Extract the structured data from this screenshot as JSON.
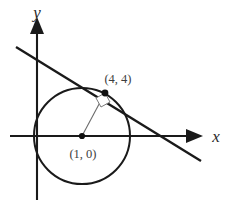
{
  "figure": {
    "background_color": "#ffffff",
    "stroke_color": "#1a1a1a",
    "label_color": "#3d3d3d",
    "radius_color": "#6b6b6b"
  },
  "axes": {
    "x_label": "x",
    "y_label": "y",
    "x_axis": {
      "x1": 10,
      "y1": 136,
      "x2": 186,
      "y2": 136
    },
    "y_axis": {
      "x1": 37,
      "y1": 200,
      "x2": 37,
      "y2": 34
    },
    "x_arrow_points": "186,129 203,136 186,143",
    "y_arrow_points": "30,34 37,17 44,34"
  },
  "circle": {
    "center_x": 82,
    "center_y": 136,
    "radius": 48
  },
  "center_point": {
    "label": "(1, 0)",
    "cx": 82,
    "cy": 136,
    "dot_radius": 3.1,
    "label_x": 83,
    "label_y": 158
  },
  "tangent_point": {
    "label": "(4, 4)",
    "cx": 105,
    "cy": 93,
    "dot_radius": 3.4,
    "label_x": 118,
    "label_y": 83
  },
  "tangent_line": {
    "x1": 16,
    "y1": 47,
    "x2": 201,
    "y2": 161
  },
  "radius_segment": {
    "x1": 82,
    "y1": 136,
    "x2": 105,
    "y2": 93
  },
  "right_angle_marker": {
    "points": "105,93 96,98 101,107 110,102",
    "size": 9
  },
  "chart_data": {
    "type": "scatter",
    "xlabel": "x",
    "ylabel": "y",
    "grid": false,
    "legend": "none",
    "annotations": [
      "(1, 0)",
      "(4, 4)"
    ],
    "shapes": [
      {
        "kind": "circle",
        "center": [
          1,
          0
        ],
        "radius": 5,
        "label": "(1, 0)"
      },
      {
        "kind": "point",
        "coords": [
          1,
          0
        ],
        "label": "(1, 0)",
        "role": "circle-center"
      },
      {
        "kind": "point",
        "coords": [
          4,
          4
        ],
        "label": "(4, 4)",
        "role": "tangent-point"
      },
      {
        "kind": "line",
        "role": "radius",
        "from": [
          1,
          0
        ],
        "to": [
          4,
          4
        ]
      },
      {
        "kind": "line",
        "role": "tangent",
        "through": [
          4,
          4
        ],
        "slope": -0.75
      },
      {
        "kind": "right-angle",
        "at": [
          4,
          4
        ],
        "between": [
          "radius",
          "tangent"
        ]
      }
    ]
  }
}
